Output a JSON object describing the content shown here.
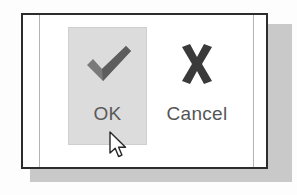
{
  "dialog": {
    "background_color": "#ffffff",
    "border_color": "#2c2c2c",
    "shadow_color": "#c9c9c9",
    "guide_rule_color": "#b4b4b4"
  },
  "buttons": [
    {
      "id": "ok",
      "label": "OK",
      "icon": "check-icon",
      "icon_color": "#7a7a7a",
      "state": "highlighted",
      "highlight_color": "#dcdcdc",
      "label_color": "#5a5a5a"
    },
    {
      "id": "cancel",
      "label": "Cancel",
      "icon": "x-icon",
      "icon_color": "#3a3a3a",
      "state": "normal",
      "highlight_color": "transparent",
      "label_color": "#555555"
    }
  ],
  "cursor": {
    "type": "arrow-pointer",
    "fill": "#ffffff",
    "stroke": "#262626",
    "x": 108,
    "y": 131
  }
}
